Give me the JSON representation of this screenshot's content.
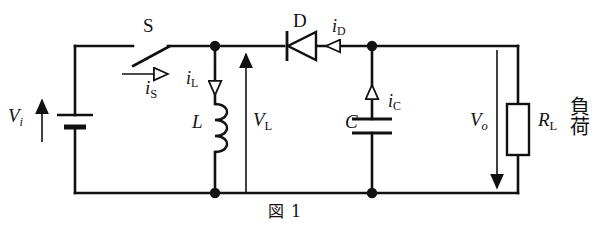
{
  "figure": {
    "caption": "図 1",
    "type": "boost-converter-schematic"
  },
  "components": {
    "source": {
      "symbol": "battery",
      "label_base": "V",
      "label_sub": "i",
      "label_full": "Vi"
    },
    "switch": {
      "symbol": "spst-switch-open",
      "label": "S"
    },
    "inductor": {
      "symbol": "inductor-coil",
      "label": "L"
    },
    "diode": {
      "symbol": "diode",
      "label": "D"
    },
    "capacitor": {
      "symbol": "capacitor",
      "label": "C"
    },
    "load_resistor": {
      "symbol": "resistor-box",
      "label_base": "R",
      "label_sub": "L",
      "label_full": "RL",
      "annotation": "負荷"
    }
  },
  "annotations": {
    "source_voltage": {
      "base": "V",
      "sub": "i"
    },
    "switch_current": {
      "base": "i",
      "sub": "S"
    },
    "inductor_current": {
      "base": "i",
      "sub": "L"
    },
    "inductor_voltage": {
      "base": "V",
      "sub": "L"
    },
    "diode_current": {
      "base": "i",
      "sub": "D"
    },
    "capacitor_current": {
      "base": "i",
      "sub": "C"
    },
    "output_voltage": {
      "base": "V",
      "sub": "o"
    }
  },
  "colors": {
    "wire": "#111111",
    "background": "#ffffff",
    "text": "#111111"
  }
}
